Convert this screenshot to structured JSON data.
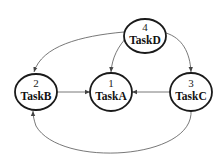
{
  "diagram": {
    "type": "directed-graph",
    "colors": {
      "node_stroke": "#1a1a1a",
      "edge_stroke": "#555555",
      "background": "#ffffff"
    },
    "nodes": [
      {
        "id": "A",
        "number": "1",
        "label": "TaskA"
      },
      {
        "id": "B",
        "number": "2",
        "label": "TaskB"
      },
      {
        "id": "C",
        "number": "3",
        "label": "TaskC"
      },
      {
        "id": "D",
        "number": "4",
        "label": "TaskD"
      }
    ],
    "edges": [
      {
        "from": "TaskD",
        "to": "TaskB"
      },
      {
        "from": "TaskD",
        "to": "TaskA"
      },
      {
        "from": "TaskD",
        "to": "TaskC"
      },
      {
        "from": "TaskB",
        "to": "TaskA"
      },
      {
        "from": "TaskC",
        "to": "TaskA"
      },
      {
        "from": "TaskC",
        "to": "TaskB"
      }
    ]
  }
}
